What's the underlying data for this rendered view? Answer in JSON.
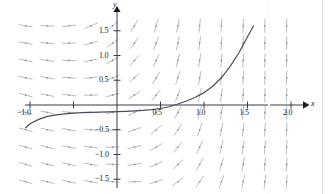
{
  "figure": {
    "axis_labels": {
      "x": "x",
      "y": "y"
    },
    "background_color": "#ffffff",
    "axis_color": "#3a3a4a",
    "field_color": "#9aa0a8",
    "curve_color": "#4a4f57"
  },
  "x_ticks": [
    {
      "value": -1.0,
      "label": "−1.0"
    },
    {
      "value": -0.5,
      "label": ""
    },
    {
      "value": 0.5,
      "label": "0.5"
    },
    {
      "value": 1.0,
      "label": "1.0"
    },
    {
      "value": 1.5,
      "label": "1.5"
    },
    {
      "value": 2.0,
      "label": "2.0"
    }
  ],
  "y_ticks": [
    {
      "value": 1.5,
      "label": "1.5"
    },
    {
      "value": 1.0,
      "label": "1.0"
    },
    {
      "value": 0.5,
      "label": "0.5"
    },
    {
      "value": -0.5,
      "label": "−0.5"
    },
    {
      "value": -1.0,
      "label": "−1.0"
    },
    {
      "value": -1.5,
      "label": "−1.5"
    }
  ],
  "chart_data": {
    "type": "line",
    "title": "",
    "subtitle": "",
    "xlabel": "x",
    "ylabel": "y",
    "xlim": [
      -1.1,
      2.15
    ],
    "ylim": [
      -1.65,
      1.75
    ],
    "grid": false,
    "legend": null,
    "annotations": [],
    "field": {
      "description": "direction field of dy/dx increasing with x and y; segments nearly horizontal at lower left, nearly vertical at right",
      "x_start": -1.05,
      "x_end": 2.05,
      "x_step": 0.25,
      "y_start": -1.55,
      "y_end": 1.65,
      "y_step": 0.35,
      "segment_length_px": 14,
      "slope_model": "tan(atan_scale) where slope = exp(2.1*x + 0.55*y) - 0.55",
      "slope_a": 2.1,
      "slope_b": 0.55,
      "slope_c": 0.55
    },
    "series": [
      {
        "name": "solution-curve",
        "x": [
          -1.05,
          -1.0,
          -0.9,
          -0.8,
          -0.7,
          -0.6,
          -0.5,
          -0.4,
          -0.3,
          -0.2,
          -0.1,
          0.0,
          0.1,
          0.2,
          0.3,
          0.4,
          0.5,
          0.6,
          0.7,
          0.8,
          0.9,
          1.0,
          1.1,
          1.2,
          1.3,
          1.4,
          1.5,
          1.57
        ],
        "y": [
          -0.46,
          -0.38,
          -0.29,
          -0.23,
          -0.2,
          -0.18,
          -0.165,
          -0.155,
          -0.15,
          -0.145,
          -0.14,
          -0.135,
          -0.128,
          -0.12,
          -0.11,
          -0.095,
          -0.07,
          -0.035,
          0.02,
          0.08,
          0.155,
          0.25,
          0.38,
          0.55,
          0.78,
          1.05,
          1.38,
          1.6
        ]
      }
    ]
  }
}
